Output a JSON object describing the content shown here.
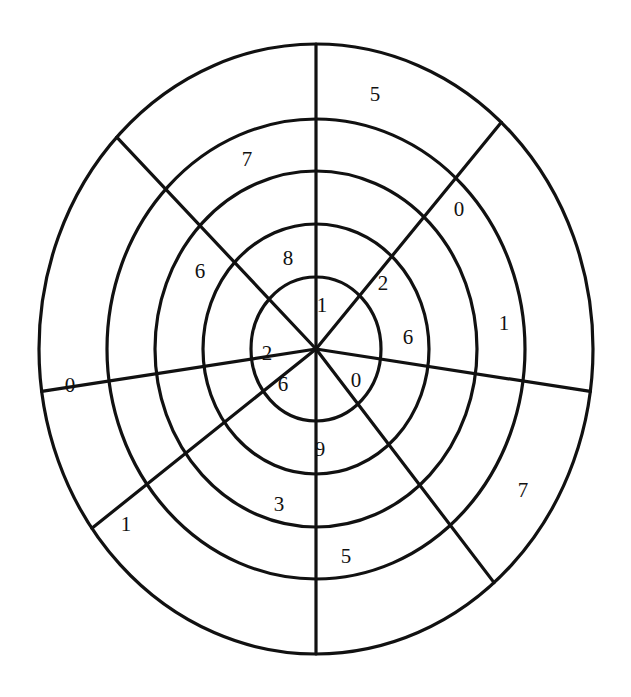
{
  "figure": {
    "kind": "radial-sector-grid",
    "title": "",
    "background_color": "#ffffff",
    "stroke_color": "#111111",
    "text_color": "#111111",
    "center": {
      "x": 316,
      "y": 349
    },
    "ring_count": 5,
    "sector_count": 8,
    "ring_radii_x": [
      65,
      113,
      161,
      209,
      277
    ],
    "ring_radii_y": [
      72,
      125,
      178,
      230,
      305
    ],
    "divider_angles_deg": [
      90,
      48,
      352,
      310,
      270,
      216,
      188,
      136
    ],
    "labels": [
      {
        "text": "1",
        "x": 322,
        "y": 305,
        "ring": 1,
        "sector": 1
      },
      {
        "text": "2",
        "x": 267,
        "y": 353,
        "ring": 1,
        "sector": 6
      },
      {
        "text": "6",
        "x": 283,
        "y": 384,
        "ring": 1,
        "sector": 5
      },
      {
        "text": "0",
        "x": 356,
        "y": 380,
        "ring": 1,
        "sector": 4
      },
      {
        "text": "8",
        "x": 288,
        "y": 258,
        "ring": 2,
        "sector": 2
      },
      {
        "text": "2",
        "x": 383,
        "y": 283,
        "ring": 2,
        "sector": 8
      },
      {
        "text": "6",
        "x": 408,
        "y": 337,
        "ring": 2,
        "sector": 7
      },
      {
        "text": "9",
        "x": 320,
        "y": 449,
        "ring": 2,
        "sector": 4
      },
      {
        "text": "6",
        "x": 200,
        "y": 271,
        "ring": 3,
        "sector": 2
      },
      {
        "text": "3",
        "x": 279,
        "y": 504,
        "ring": 3,
        "sector": 5
      },
      {
        "text": "5",
        "x": 346,
        "y": 556,
        "ring": 4,
        "sector": 4
      },
      {
        "text": "7",
        "x": 247,
        "y": 159,
        "ring": 4,
        "sector": 1
      },
      {
        "text": "0",
        "x": 459,
        "y": 209,
        "ring": 4,
        "sector": 8
      },
      {
        "text": "1",
        "x": 504,
        "y": 323,
        "ring": 4,
        "sector": 7
      },
      {
        "text": "7",
        "x": 523,
        "y": 490,
        "ring": 5,
        "sector": 6
      },
      {
        "text": "5",
        "x": 375,
        "y": 94,
        "ring": 5,
        "sector": 1
      },
      {
        "text": "0",
        "x": 70,
        "y": 385,
        "ring": 5,
        "sector": 4
      },
      {
        "text": "1",
        "x": 126,
        "y": 524,
        "ring": 5,
        "sector": 5
      }
    ]
  },
  "chart_data": {
    "type": "table",
    "title": "",
    "xlabel": "",
    "ylabel": "",
    "legend": [],
    "grid": true,
    "rings": [
      {
        "ring": 1,
        "values": [
          "1",
          "2",
          "6",
          "0"
        ]
      },
      {
        "ring": 2,
        "values": [
          "8",
          "2",
          "6",
          "9"
        ]
      },
      {
        "ring": 3,
        "values": [
          "6",
          "3"
        ]
      },
      {
        "ring": 4,
        "values": [
          "7",
          "0",
          "1",
          "5"
        ]
      },
      {
        "ring": 5,
        "values": [
          "5",
          "0",
          "1",
          "7"
        ]
      }
    ],
    "all_digits": [
      "1",
      "2",
      "6",
      "0",
      "8",
      "2",
      "6",
      "9",
      "6",
      "3",
      "5",
      "7",
      "0",
      "1",
      "7",
      "5",
      "0",
      "1"
    ]
  }
}
